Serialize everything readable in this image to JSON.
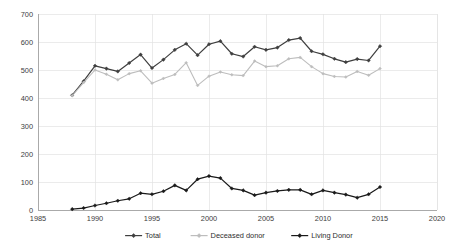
{
  "chart_data": {
    "type": "line",
    "title": "",
    "subtitle": "",
    "xlabel": "",
    "ylabel": "",
    "xlim": [
      1985,
      2020
    ],
    "ylim": [
      0,
      700
    ],
    "xticks": [
      1985,
      1990,
      1995,
      2000,
      2005,
      2010,
      2015,
      2020
    ],
    "yticks": [
      0,
      100,
      200,
      300,
      400,
      500,
      600,
      700
    ],
    "grid": true,
    "legend_position": "bottom",
    "x": [
      1988,
      1989,
      1990,
      1991,
      1992,
      1993,
      1994,
      1995,
      1996,
      1997,
      1998,
      1999,
      2000,
      2001,
      2002,
      2003,
      2004,
      2005,
      2006,
      2007,
      2008,
      2009,
      2010,
      2011,
      2012,
      2013,
      2014,
      2015
    ],
    "series": [
      {
        "name": "Total",
        "color": "#3f3f3f",
        "marker": "diamond",
        "values": [
          410,
          460,
          515,
          505,
          495,
          525,
          555,
          507,
          537,
          572,
          594,
          553,
          592,
          603,
          558,
          548,
          583,
          572,
          580,
          607,
          614,
          567,
          556,
          540,
          528,
          539,
          534,
          585
        ]
      },
      {
        "name": "Deceased donor",
        "color": "#bdbdbd",
        "marker": "diamond",
        "values": [
          408,
          455,
          500,
          485,
          465,
          487,
          497,
          453,
          470,
          484,
          526,
          445,
          478,
          493,
          483,
          480,
          532,
          512,
          515,
          540,
          545,
          512,
          487,
          477,
          475,
          495,
          481,
          505
        ]
      },
      {
        "name": "Living  Donor",
        "color": "#1a1a1a",
        "marker": "diamond",
        "values": [
          3,
          7,
          16,
          24,
          33,
          40,
          60,
          56,
          67,
          88,
          70,
          110,
          121,
          114,
          77,
          70,
          53,
          62,
          68,
          72,
          72,
          56,
          70,
          62,
          55,
          44,
          56,
          82
        ]
      }
    ]
  },
  "axes": {
    "y_tick_labels": [
      "700",
      "600",
      "500",
      "400",
      "300",
      "200",
      "100",
      "0"
    ],
    "x_tick_labels": [
      "1985",
      "1990",
      "1995",
      "2000",
      "2005",
      "2010",
      "2015",
      "2020"
    ]
  },
  "legend": {
    "items": [
      {
        "label": "Total",
        "color": "#3f3f3f"
      },
      {
        "label": "Deceased donor",
        "color": "#bdbdbd"
      },
      {
        "label": "Living  Donor",
        "color": "#1a1a1a"
      }
    ]
  }
}
